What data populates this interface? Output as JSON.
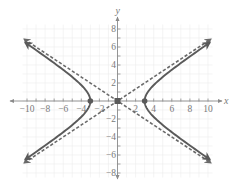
{
  "chart_data": {
    "type": "line",
    "title": "",
    "xlabel": "x",
    "ylabel": "y",
    "xlim": [
      -10.5,
      10.5
    ],
    "ylim": [
      -8.5,
      8.5
    ],
    "grid": true,
    "x_ticks": [
      -10,
      -8,
      -6,
      -4,
      -2,
      2,
      4,
      6,
      8,
      10
    ],
    "y_ticks": [
      -8,
      -6,
      -4,
      -2,
      2,
      4,
      6,
      8
    ],
    "x_tick_labels": [
      "−10",
      "−8",
      "−6",
      "−4",
      "−2",
      "2",
      "4",
      "6",
      "8",
      "10"
    ],
    "y_tick_labels": [
      "−8",
      "−6",
      "−4",
      "−2",
      "2",
      "4",
      "6",
      "8"
    ],
    "series": [
      {
        "name": "hyperbola",
        "equation": "x^2/9 - y^2/4 = 1",
        "style": "solid",
        "vertices": [
          [
            -3,
            0
          ],
          [
            3,
            0
          ]
        ],
        "x_range": [
          -10.3,
          10.3
        ]
      },
      {
        "name": "asymptote-1",
        "equation": "y = (2/3)x",
        "style": "dashed",
        "x_range": [
          -10.3,
          10.3
        ]
      },
      {
        "name": "asymptote-2",
        "equation": "y = -(2/3)x",
        "style": "dashed",
        "x_range": [
          -10.3,
          10.3
        ]
      }
    ],
    "points": [
      {
        "name": "vertex-left",
        "x": -3,
        "y": 0,
        "marker": "circle"
      },
      {
        "name": "vertex-right",
        "x": 3,
        "y": 0,
        "marker": "circle"
      },
      {
        "name": "center",
        "x": 0,
        "y": 0,
        "marker": "square"
      }
    ],
    "colors": {
      "curve": "#5a5a5a",
      "asymptote": "#6a6a6a",
      "axis": "#8a8a8a",
      "grid": "#ececec",
      "text": "#7a7a7a"
    }
  }
}
